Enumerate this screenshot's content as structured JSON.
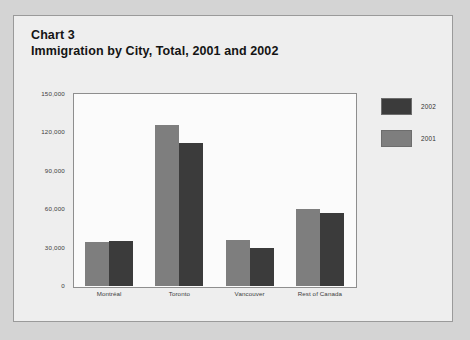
{
  "card": {
    "title_line_1": "Chart 3",
    "title_line_2": "Immigration by City, Total, 2001 and 2002"
  },
  "legend": {
    "position": "right",
    "items": [
      {
        "label": "2002",
        "color": "#3b3b3b"
      },
      {
        "label": "2001",
        "color": "#7e7e7e"
      }
    ]
  },
  "axis": {
    "y_ticks": [
      "150,000",
      "120,000",
      "90,000",
      "60,000",
      "30,000",
      "0"
    ],
    "x_labels": [
      "Montréal",
      "Toronto",
      "Vancouver",
      "Rest of Canada"
    ]
  },
  "chart_data": {
    "type": "bar",
    "title": "Immigration by City, Total, 2001 and 2002",
    "subtitle": "Chart 3",
    "xlabel": "",
    "ylabel": "",
    "ylim": [
      0,
      150000
    ],
    "yticks": [
      0,
      30000,
      60000,
      90000,
      120000,
      150000
    ],
    "ytick_labels": [
      "0",
      "30,000",
      "60,000",
      "90,000",
      "120,000",
      "150,000"
    ],
    "grid": false,
    "legend_position": "right",
    "categories": [
      "Montréal",
      "Toronto",
      "Vancouver",
      "Rest of Canada"
    ],
    "series": [
      {
        "name": "2001",
        "color": "#7e7e7e",
        "values": [
          34000,
          126000,
          36000,
          60000
        ]
      },
      {
        "name": "2002",
        "color": "#3b3b3b",
        "values": [
          35000,
          112000,
          30000,
          57000
        ]
      }
    ]
  }
}
